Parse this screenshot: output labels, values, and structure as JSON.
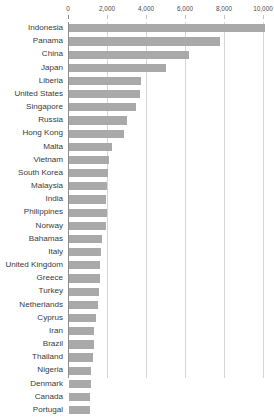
{
  "chart_data": {
    "type": "bar",
    "orientation": "horizontal",
    "title": "",
    "subtitle": "",
    "xlabel": "",
    "ylabel": "",
    "xlim": [
      0,
      10000
    ],
    "grid": true,
    "legend": null,
    "axis_position": "top",
    "tick_labels": [
      "0",
      "2,000",
      "4,000",
      "6,000",
      "8,000",
      "10,000"
    ],
    "ticks": [
      0,
      2000,
      4000,
      6000,
      8000,
      10000
    ],
    "bar_color": "#a9a9a9",
    "gridline_color": "#d6d6d6",
    "axis_color": "#8c8c8c",
    "note": "bottom of chart is cut off; Portugal row is clipped",
    "categories": [
      "Indonesia",
      "Panama",
      "China",
      "Japan",
      "Liberia",
      "United States",
      "Singapore",
      "Russia",
      "Hong Kong",
      "Malta",
      "Vietnam",
      "South Korea",
      "Malaysia",
      "India",
      "Philippines",
      "Norway",
      "Bahamas",
      "Italy",
      "United Kingdom",
      "Greece",
      "Turkey",
      "Netherlands",
      "Cyprus",
      "Iran",
      "Brazil",
      "Thailand",
      "Nigeria",
      "Denmark",
      "Canada",
      "Portugal"
    ],
    "values": [
      10050,
      7750,
      6150,
      4950,
      3700,
      3650,
      3450,
      2950,
      2800,
      2200,
      2050,
      2000,
      1950,
      1900,
      1950,
      1900,
      1700,
      1650,
      1600,
      1600,
      1550,
      1500,
      1400,
      1300,
      1300,
      1250,
      1150,
      1150,
      1100,
      1100
    ]
  }
}
